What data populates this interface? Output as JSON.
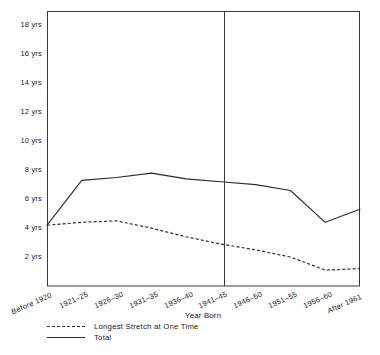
{
  "chart_data": {
    "type": "line",
    "title": "",
    "xlabel": "Year Born",
    "ylabel": "",
    "categories": [
      "Before 1920",
      "1921–25",
      "1926–30",
      "1931–35",
      "1936–40",
      "1941–45",
      "1946–50",
      "1951–55",
      "1956–60",
      "After 1961"
    ],
    "ylim": [
      0,
      19
    ],
    "yticks": [
      2,
      4,
      6,
      8,
      10,
      12,
      14,
      16,
      18
    ],
    "ytick_labels": [
      "2 yrs",
      "4 yrs",
      "6 yrs",
      "8 yrs",
      "10 yrs",
      "12 yrs",
      "14 yrs",
      "16 yrs",
      "18 yrs"
    ],
    "grid": false,
    "legend_position": "below-left",
    "series": [
      {
        "name": "Longest Stretch at One Time",
        "style": "dashed",
        "color": "#2b2b2b",
        "values": [
          4.2,
          4.4,
          4.5,
          4.0,
          3.4,
          2.9,
          2.5,
          2.0,
          1.1,
          1.2
        ]
      },
      {
        "name": "Total",
        "style": "solid",
        "color": "#2b2b2b",
        "values": [
          4.2,
          7.3,
          7.5,
          7.8,
          7.4,
          7.2,
          7.0,
          6.6,
          4.4,
          5.3
        ]
      }
    ],
    "annotations": [
      {
        "type": "vertical-divider",
        "at_category_index": 6,
        "label": ""
      }
    ]
  },
  "axes": {
    "plot_box": {
      "left": 47,
      "top": 11,
      "right": 360,
      "bottom": 286
    },
    "divider_x": 224
  }
}
